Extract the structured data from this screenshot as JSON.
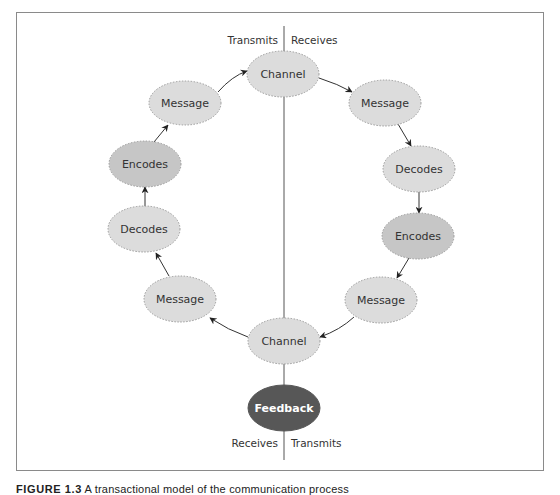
{
  "figure": {
    "caption_label": "FIGURE 1.3",
    "caption_text": "A transactional model of the communication process"
  },
  "colors": {
    "frame": "#8a8a8a",
    "light_node": "#dcdcdc",
    "mid_node": "#c6c6c6",
    "dark_node": "#575757",
    "node_border": "#9a9a9a",
    "line": "#444444",
    "text": "#333333",
    "dark_text": "#ffffff"
  },
  "top_labels": {
    "left": "Transmits",
    "right": "Receives"
  },
  "bottom_labels": {
    "left": "Receives",
    "right": "Transmits"
  },
  "nodes": [
    {
      "id": "channel-top",
      "label": "Channel",
      "cx": 283,
      "cy": 74,
      "shade": "light"
    },
    {
      "id": "message-right-top",
      "label": "Message",
      "cx": 385,
      "cy": 103,
      "shade": "light"
    },
    {
      "id": "decodes-right",
      "label": "Decodes",
      "cx": 419,
      "cy": 169,
      "shade": "light"
    },
    {
      "id": "encodes-right",
      "label": "Encodes",
      "cx": 418,
      "cy": 236,
      "shade": "mid"
    },
    {
      "id": "message-right-bottom",
      "label": "Message",
      "cx": 381,
      "cy": 300,
      "shade": "light"
    },
    {
      "id": "channel-bottom",
      "label": "Channel",
      "cx": 284,
      "cy": 341,
      "shade": "light"
    },
    {
      "id": "message-left-bottom",
      "label": "Message",
      "cx": 180,
      "cy": 299,
      "shade": "light"
    },
    {
      "id": "decodes-left",
      "label": "Decodes",
      "cx": 144,
      "cy": 229,
      "shade": "light"
    },
    {
      "id": "encodes-left",
      "label": "Encodes",
      "cx": 145,
      "cy": 164,
      "shade": "mid"
    },
    {
      "id": "message-left-top",
      "label": "Message",
      "cx": 185,
      "cy": 103,
      "shade": "light"
    },
    {
      "id": "feedback",
      "label": "Feedback",
      "cx": 284,
      "cy": 408,
      "shade": "dark"
    }
  ]
}
